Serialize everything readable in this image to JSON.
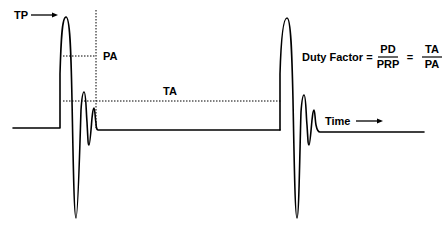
{
  "diagram": {
    "labels": {
      "tp": "TP",
      "pa": "PA",
      "ta": "TA",
      "time": "Time"
    },
    "formula": {
      "lhs": "Duty Factor =",
      "frac1_num": "PD",
      "frac1_den": "PRP",
      "equals": "=",
      "frac2_num": "TA",
      "frac2_den": "PA"
    },
    "colors": {
      "stroke": "#000000",
      "background": "#ffffff"
    }
  }
}
